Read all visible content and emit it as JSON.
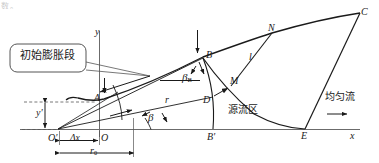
{
  "figure": {
    "title_fragment": "数。",
    "background_color": "#ffffff",
    "line_color": "#1a1a1a",
    "callout": {
      "text": "初始膨胀段",
      "shape": "rounded-rect-callout",
      "border_color": "#555555"
    },
    "region_labels": [
      {
        "id": "source-region",
        "text": "源流区"
      },
      {
        "id": "uniform-flow",
        "text": "均匀流"
      }
    ],
    "axes": [
      {
        "id": "x-axis",
        "label": "x"
      },
      {
        "id": "y-axis",
        "label": "y"
      },
      {
        "id": "y-prime-axis",
        "label": "y'"
      }
    ],
    "origins": [
      {
        "id": "origin-O",
        "label": "O"
      },
      {
        "id": "origin-O-prime",
        "label": "O'"
      }
    ],
    "points": [
      {
        "id": "point-A",
        "label": "A"
      },
      {
        "id": "point-B",
        "label": "B"
      },
      {
        "id": "point-B-prime",
        "label": "B'"
      },
      {
        "id": "point-C",
        "label": "C"
      },
      {
        "id": "point-D",
        "label": "D"
      },
      {
        "id": "point-E",
        "label": "E"
      },
      {
        "id": "point-M",
        "label": "M"
      },
      {
        "id": "point-N",
        "label": "N"
      }
    ],
    "angles": [
      {
        "id": "angle-beta",
        "label": "β"
      },
      {
        "id": "angle-beta-B",
        "label": "β",
        "subscript": "B"
      }
    ],
    "dimensions": [
      {
        "id": "radius-r",
        "label": "r"
      },
      {
        "id": "length-l",
        "label": "l"
      },
      {
        "id": "radius-r0",
        "label": "r",
        "subscript": "0"
      },
      {
        "id": "delta-x",
        "label": "Δx"
      },
      {
        "id": "height-y-prime",
        "label": "y'"
      }
    ],
    "flow_arrow": {
      "id": "flow-direction-arrow",
      "glyph": "→"
    }
  }
}
